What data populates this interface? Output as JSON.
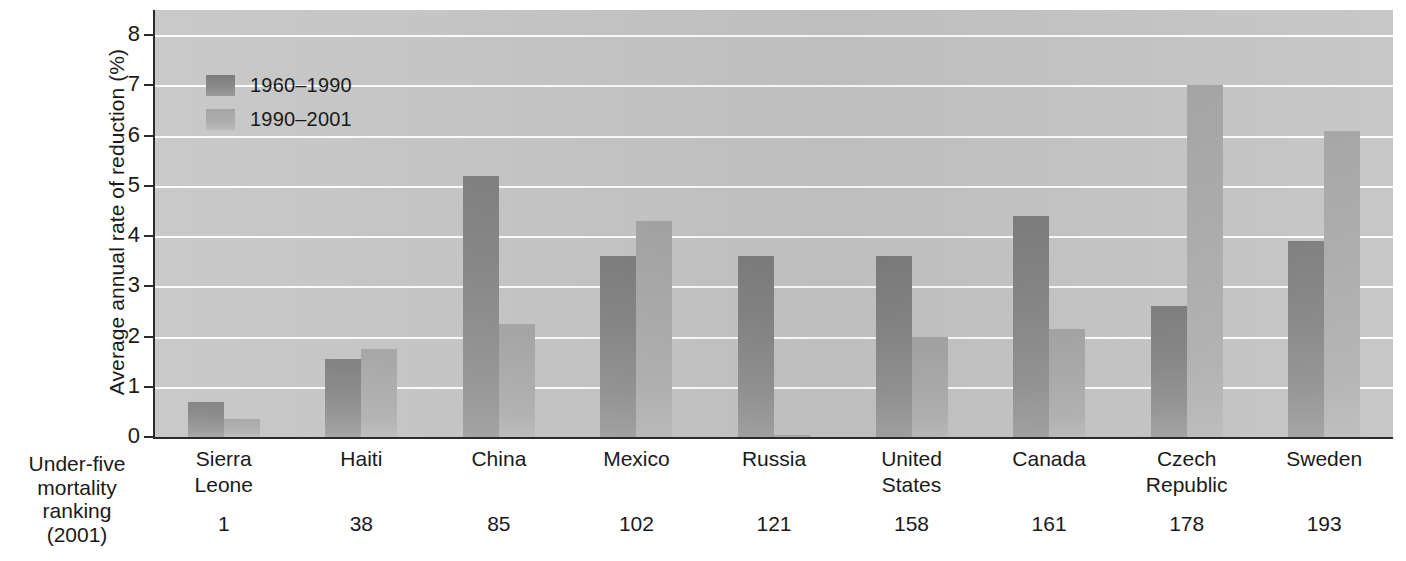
{
  "chart_data": {
    "type": "bar",
    "title": "",
    "xlabel": "",
    "ylabel": "Average annual rate of reduction (%)",
    "ylim": [
      0,
      8.5
    ],
    "yticks": [
      0,
      1,
      2,
      3,
      4,
      5,
      6,
      7,
      8
    ],
    "ytick_labels": [
      "0",
      "1",
      "2",
      "3",
      "4",
      "5",
      "6",
      "7",
      "8"
    ],
    "grid": true,
    "legend_position": "inside-top-left",
    "categories": [
      "Sierra\nLeone",
      "Haiti",
      "China",
      "Mexico",
      "Russia",
      "United\nStates",
      "Canada",
      "Czech\nRepublic",
      "Sweden"
    ],
    "series": [
      {
        "name": "1960–1990",
        "color": "#8a8a8a",
        "values": [
          0.7,
          1.55,
          5.2,
          3.6,
          3.6,
          3.6,
          4.4,
          2.6,
          3.9
        ]
      },
      {
        "name": "1990–2001",
        "color": "#adadad",
        "values": [
          0.35,
          1.75,
          2.25,
          4.3,
          0.05,
          2.0,
          2.15,
          7.0,
          6.1
        ]
      }
    ],
    "secondary_axis": {
      "label": "Under-five\nmortality\nranking\n(2001)",
      "values": [
        "1",
        "38",
        "85",
        "102",
        "121",
        "158",
        "161",
        "178",
        "193"
      ]
    }
  },
  "categories_display": [
    {
      "line1": "Sierra",
      "line2": "Leone"
    },
    {
      "line1": "Haiti",
      "line2": ""
    },
    {
      "line1": "China",
      "line2": ""
    },
    {
      "line1": "Mexico",
      "line2": ""
    },
    {
      "line1": "Russia",
      "line2": ""
    },
    {
      "line1": "United",
      "line2": "States"
    },
    {
      "line1": "Canada",
      "line2": ""
    },
    {
      "line1": "Czech",
      "line2": "Republic"
    },
    {
      "line1": "Sweden",
      "line2": ""
    }
  ],
  "corner_label": {
    "line1": "Under-five",
    "line2": "mortality",
    "line3": "ranking",
    "line4": "(2001)"
  },
  "legend": {
    "items": [
      {
        "label": "1960–1990"
      },
      {
        "label": "1990–2001"
      }
    ]
  },
  "ranks": [
    "1",
    "38",
    "85",
    "102",
    "121",
    "158",
    "161",
    "178",
    "193"
  ],
  "ytick_labels": [
    "8",
    "7",
    "6",
    "5",
    "4",
    "3",
    "2",
    "1",
    "0"
  ],
  "y_axis_title": "Average annual rate of reduction (%)",
  "colors": {
    "series1": "#8a8a8a",
    "series2": "#adadad",
    "plot_background": "#c5c5c5",
    "gridline": "#fdfdfd",
    "axis": "#2b2b2b",
    "text": "#1a1a1a"
  }
}
